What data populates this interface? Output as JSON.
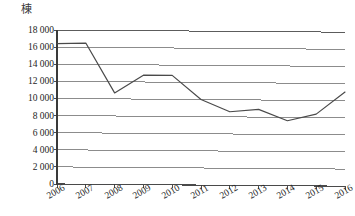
{
  "chart_data": {
    "type": "line",
    "title": "",
    "subtitle": "",
    "xlabel": "",
    "ylabel": "棟",
    "y_unit_label": "棟",
    "categories": [
      "2006",
      "2007",
      "2008",
      "2009",
      "2010",
      "2011",
      "2012",
      "2013",
      "2014",
      "2015",
      "2016"
    ],
    "x": [
      2006,
      2007,
      2008,
      2009,
      2010,
      2011,
      2012,
      2013,
      2014,
      2015,
      2016
    ],
    "values": [
      16400,
      16500,
      10700,
      12800,
      12800,
      10000,
      8600,
      8900,
      7600,
      8400,
      11000
    ],
    "series": [
      {
        "name": "",
        "values": [
          16400,
          16500,
          10700,
          12800,
          12800,
          10000,
          8600,
          8900,
          7600,
          8400,
          11000
        ]
      }
    ],
    "ylim": [
      0,
      18000
    ],
    "yticks": [
      0,
      2000,
      4000,
      6000,
      8000,
      10000,
      12000,
      14000,
      16000,
      18000
    ],
    "ytick_labels": [
      "0",
      "2 000",
      "4 000",
      "6 000",
      "8 000",
      "10 000",
      "12 000",
      "14 000",
      "16 000",
      "18 000"
    ],
    "xtick_labels": [
      "2006",
      "2007",
      "2008",
      "2009",
      "2010",
      "2011",
      "2012",
      "2013",
      "2014",
      "2015",
      "2016"
    ],
    "grid": true,
    "grid_axis": "y",
    "legend": false,
    "legend_position": "none",
    "markers": false,
    "line_color": "#4a4a4a",
    "grid_color": "#808080",
    "axis_color": "#3a3a3a",
    "background_color": "#ffffff"
  }
}
